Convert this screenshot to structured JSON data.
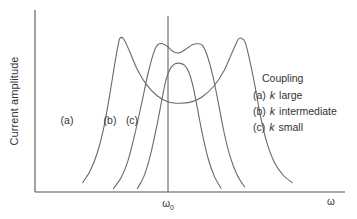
{
  "figure": {
    "background": "#ffffff",
    "curve_color": "#6a6a6a",
    "axis_color": "#555555",
    "text_color": "#333333"
  },
  "axes": {
    "ylabel": "Current amplitude",
    "xlabel": "ω",
    "x_tick_label": "ω",
    "x_tick_subscript": "0"
  },
  "curve_tags": [
    {
      "id": "tag-a",
      "label": "(a)"
    },
    {
      "id": "tag-b",
      "label": "(b)"
    },
    {
      "id": "tag-c",
      "label": "(c)"
    }
  ],
  "legend": {
    "title": "Coupling",
    "entries": [
      {
        "marker": "(a)",
        "symbol": "k",
        "text": "large"
      },
      {
        "marker": "(b)",
        "symbol": "k",
        "text": "intermediate"
      },
      {
        "marker": "(c)",
        "symbol": "k",
        "text": "small"
      }
    ]
  },
  "chart_data": {
    "type": "line",
    "title": "",
    "xlabel": "ω",
    "ylabel": "Current amplitude",
    "xlim": [
      0,
      1
    ],
    "ylim": [
      0,
      1
    ],
    "grid": false,
    "legend_position": "right",
    "annotations": [
      {
        "text": "(a)",
        "x": 0.11,
        "y": 0.4
      },
      {
        "text": "(b)",
        "x": 0.26,
        "y": 0.4
      },
      {
        "text": "(c)",
        "x": 0.33,
        "y": 0.4
      }
    ],
    "x_ticks": [
      {
        "value": 0.46,
        "label": "ω₀"
      }
    ],
    "series": [
      {
        "name": "(a) k large",
        "peak_count": 2,
        "peak_x": [
          0.274,
          0.662
        ],
        "peak_y": [
          0.905,
          0.905
        ],
        "center_dip_y": 0.525,
        "path_points": [
          [
            0.154,
            0.055
          ],
          [
            0.178,
            0.125
          ],
          [
            0.2,
            0.225
          ],
          [
            0.221,
            0.37
          ],
          [
            0.24,
            0.56
          ],
          [
            0.256,
            0.74
          ],
          [
            0.268,
            0.862
          ],
          [
            0.274,
            0.905
          ],
          [
            0.286,
            0.9
          ],
          [
            0.305,
            0.828
          ],
          [
            0.33,
            0.72
          ],
          [
            0.36,
            0.63
          ],
          [
            0.395,
            0.565
          ],
          [
            0.43,
            0.53
          ],
          [
            0.468,
            0.522
          ],
          [
            0.505,
            0.53
          ],
          [
            0.54,
            0.56
          ],
          [
            0.578,
            0.625
          ],
          [
            0.61,
            0.715
          ],
          [
            0.638,
            0.83
          ],
          [
            0.655,
            0.896
          ],
          [
            0.665,
            0.905
          ],
          [
            0.678,
            0.88
          ],
          [
            0.692,
            0.78
          ],
          [
            0.71,
            0.62
          ],
          [
            0.728,
            0.44
          ],
          [
            0.748,
            0.29
          ],
          [
            0.772,
            0.175
          ],
          [
            0.8,
            0.1
          ],
          [
            0.83,
            0.055
          ]
        ]
      },
      {
        "name": "(b) k intermediate",
        "peak_count": 2,
        "peak_x": [
          0.4,
          0.53
        ],
        "peak_y": [
          0.87,
          0.87
        ],
        "center_dip_y": 0.82,
        "path_points": [
          [
            0.253,
            0.02
          ],
          [
            0.278,
            0.085
          ],
          [
            0.3,
            0.185
          ],
          [
            0.322,
            0.34
          ],
          [
            0.345,
            0.53
          ],
          [
            0.365,
            0.7
          ],
          [
            0.383,
            0.82
          ],
          [
            0.397,
            0.868
          ],
          [
            0.412,
            0.872
          ],
          [
            0.428,
            0.855
          ],
          [
            0.444,
            0.828
          ],
          [
            0.46,
            0.818
          ],
          [
            0.474,
            0.825
          ],
          [
            0.49,
            0.845
          ],
          [
            0.508,
            0.866
          ],
          [
            0.524,
            0.872
          ],
          [
            0.54,
            0.862
          ],
          [
            0.556,
            0.8
          ],
          [
            0.574,
            0.68
          ],
          [
            0.592,
            0.52
          ],
          [
            0.61,
            0.35
          ],
          [
            0.63,
            0.205
          ],
          [
            0.652,
            0.1
          ],
          [
            0.676,
            0.03
          ]
        ]
      },
      {
        "name": "(c) k small",
        "peak_count": 1,
        "peak_x": [
          0.464
        ],
        "peak_y": [
          0.755
        ],
        "path_points": [
          [
            0.33,
            0.02
          ],
          [
            0.352,
            0.095
          ],
          [
            0.372,
            0.215
          ],
          [
            0.392,
            0.38
          ],
          [
            0.41,
            0.55
          ],
          [
            0.424,
            0.67
          ],
          [
            0.438,
            0.73
          ],
          [
            0.452,
            0.755
          ],
          [
            0.468,
            0.757
          ],
          [
            0.482,
            0.746
          ],
          [
            0.496,
            0.706
          ],
          [
            0.51,
            0.62
          ],
          [
            0.524,
            0.49
          ],
          [
            0.54,
            0.34
          ],
          [
            0.558,
            0.2
          ],
          [
            0.578,
            0.095
          ],
          [
            0.6,
            0.022
          ]
        ]
      }
    ]
  }
}
